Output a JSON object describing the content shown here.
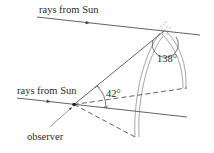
{
  "diagram": {
    "labels": {
      "top_rays": "rays from Sun",
      "bottom_rays": "rays from Sun",
      "angle_42": "42°",
      "angle_138": "138°",
      "observer": "observer"
    },
    "colors": {
      "line": "#3a3a3a",
      "background": "#ffffff"
    }
  }
}
